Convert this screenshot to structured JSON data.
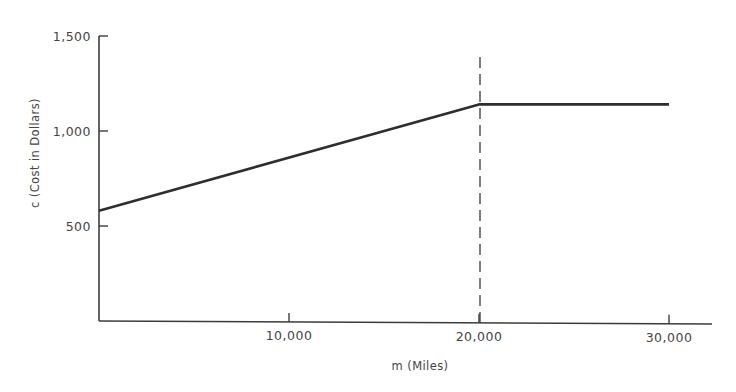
{
  "chart_data": {
    "type": "line",
    "title": "",
    "xlabel": "m (Miles)",
    "ylabel": "c (Cost in Dollars)",
    "xlim": [
      0,
      32000
    ],
    "ylim": [
      0,
      1500
    ],
    "x_ticks": [
      10000,
      20000,
      30000
    ],
    "x_tick_labels": [
      "10,000",
      "20,000",
      "30,000"
    ],
    "y_ticks": [
      500,
      1000,
      1500
    ],
    "y_tick_labels": [
      "500",
      "1,000",
      "1,500"
    ],
    "grid": false,
    "legend": null,
    "series": [
      {
        "name": "cost",
        "x": [
          0,
          20000,
          30000
        ],
        "y": [
          580,
          1140,
          1140
        ]
      }
    ],
    "annotations": [
      {
        "type": "vertical-dashed-line",
        "x": 20000,
        "y_range": [
          0,
          1500
        ]
      }
    ]
  },
  "colors": {
    "background": "#ffffff",
    "line": "#2e2e2e",
    "axis": "#3c3c3c",
    "text": "#444444"
  }
}
